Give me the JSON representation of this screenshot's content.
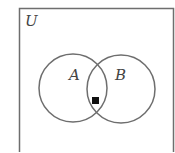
{
  "diagram": {
    "type": "venn",
    "universe_label": "U",
    "sets": [
      {
        "label": "A"
      },
      {
        "label": "B"
      }
    ],
    "marker": {
      "region": "A ∩ B",
      "shape": "filled-square"
    },
    "colors": {
      "stroke": "#6e6e6e",
      "marker": "#111111",
      "text": "#444444"
    }
  }
}
